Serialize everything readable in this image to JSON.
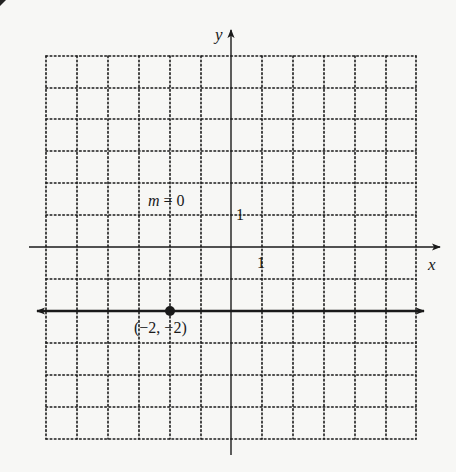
{
  "chart_data": {
    "type": "line",
    "title": "",
    "xlabel": "x",
    "ylabel": "y",
    "xlim": [
      -6,
      6
    ],
    "ylim": [
      -6,
      7
    ],
    "grid": true,
    "grid_style": "dotted",
    "tick_labels": {
      "x": "1",
      "y": "1"
    },
    "series": [
      {
        "name": "horizontal line y = -2",
        "equation": "y = -2",
        "slope": 0,
        "x": [
          -6.2,
          6.2
        ],
        "y": [
          -2,
          -2
        ],
        "arrows_both_ends": true
      }
    ],
    "points": [
      {
        "x": -2,
        "y": -2,
        "label": "(−2, −2)"
      }
    ],
    "annotations": [
      {
        "text": "m = 0",
        "x": -2.5,
        "y": 1.5
      }
    ]
  },
  "labels": {
    "x_axis": "x",
    "y_axis": "y",
    "x_tick": "1",
    "y_tick": "1",
    "slope": "m = 0",
    "point": "(−2, −2)"
  },
  "colors": {
    "ink": "#1a1a1a",
    "background": "#f7f7f5"
  }
}
